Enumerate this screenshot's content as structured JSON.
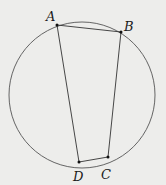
{
  "diagram": {
    "type": "inscribed-quadrilateral",
    "circle": {
      "cx": 82,
      "cy": 95,
      "r": 73,
      "stroke": "#555555"
    },
    "points": [
      {
        "id": "A",
        "label": "A",
        "x": 57,
        "y": 25,
        "lx": 46,
        "ly": 21
      },
      {
        "id": "B",
        "label": "B",
        "x": 121,
        "y": 32,
        "lx": 124,
        "ly": 31
      },
      {
        "id": "C",
        "label": "C",
        "x": 108,
        "y": 157,
        "lx": 101,
        "ly": 179
      },
      {
        "id": "D",
        "label": "D",
        "x": 79,
        "y": 162,
        "lx": 73,
        "ly": 181
      }
    ],
    "segments": [
      [
        "A",
        "B"
      ],
      [
        "B",
        "C"
      ],
      [
        "C",
        "D"
      ],
      [
        "D",
        "A"
      ]
    ],
    "line_color": "#333333",
    "background": "#ededeb"
  }
}
